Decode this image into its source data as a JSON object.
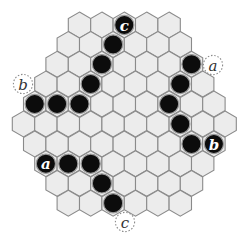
{
  "board": {
    "hex_width": 22.4,
    "hex_row_spacing": 19.75,
    "hex_fill": "#ececec",
    "hex_stroke": "#8a8a8a",
    "rows": [
      {
        "y": 25,
        "left_x": 79.5,
        "count": 5
      },
      {
        "y": 44.5,
        "left_x": 68.3,
        "count": 6
      },
      {
        "y": 64.2,
        "left_x": 57.1,
        "count": 7
      },
      {
        "y": 84,
        "left_x": 45.9,
        "count": 8
      },
      {
        "y": 104,
        "left_x": 34.7,
        "count": 9
      },
      {
        "y": 124,
        "left_x": 23.5,
        "count": 10
      },
      {
        "y": 144,
        "left_x": 34.7,
        "count": 9
      },
      {
        "y": 163.7,
        "left_x": 45.9,
        "count": 8
      },
      {
        "y": 183.4,
        "left_x": 57.1,
        "count": 7
      },
      {
        "y": 203.2,
        "left_x": 68.3,
        "count": 6
      }
    ]
  },
  "stones": [
    {
      "row": 0,
      "col": 2,
      "color": "black",
      "label": "c"
    },
    {
      "row": 1,
      "col": 2,
      "color": "black",
      "label": ""
    },
    {
      "row": 2,
      "col": 2,
      "color": "black",
      "label": ""
    },
    {
      "row": 2,
      "col": 6,
      "color": "black",
      "label": ""
    },
    {
      "row": 3,
      "col": 2,
      "color": "black",
      "label": ""
    },
    {
      "row": 3,
      "col": 6,
      "color": "black",
      "label": ""
    },
    {
      "row": 4,
      "col": 0,
      "color": "black",
      "label": ""
    },
    {
      "row": 4,
      "col": 1,
      "color": "black",
      "label": ""
    },
    {
      "row": 4,
      "col": 2,
      "color": "black",
      "label": ""
    },
    {
      "row": 4,
      "col": 6,
      "color": "black",
      "label": ""
    },
    {
      "row": 5,
      "col": 7,
      "color": "black",
      "label": ""
    },
    {
      "row": 6,
      "col": 7,
      "color": "black",
      "label": ""
    },
    {
      "row": 6,
      "col": 8,
      "color": "black",
      "label": "b"
    },
    {
      "row": 7,
      "col": 0,
      "color": "black",
      "label": "a"
    },
    {
      "row": 7,
      "col": 1,
      "color": "black",
      "label": ""
    },
    {
      "row": 7,
      "col": 2,
      "color": "black",
      "label": ""
    },
    {
      "row": 8,
      "col": 2,
      "color": "black",
      "label": ""
    },
    {
      "row": 9,
      "col": 2,
      "color": "black",
      "label": ""
    }
  ],
  "markers": [
    {
      "x": 213,
      "y": 65,
      "label": "a"
    },
    {
      "x": 23,
      "y": 84,
      "label": "b"
    },
    {
      "x": 125,
      "y": 222,
      "label": "c"
    }
  ]
}
